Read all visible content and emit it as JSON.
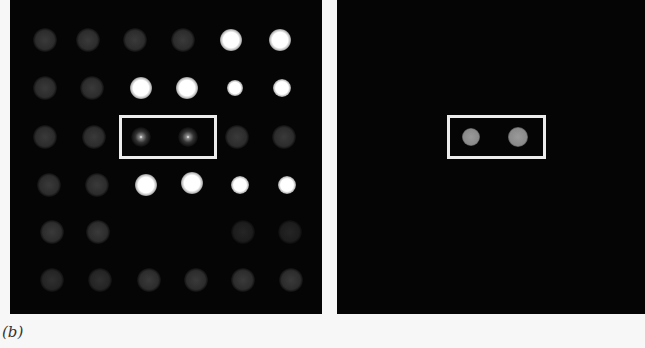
{
  "figure": {
    "caption": "(b)",
    "left_panel": {
      "description": "fluorescence microarray spots, 6x6 grid",
      "highlight_box": {
        "x": 109,
        "y": 115,
        "w": 98,
        "h": 44
      }
    },
    "right_panel": {
      "description": "filtered spots showing two highlighted spots",
      "highlight_box": {
        "x": 110,
        "y": 115,
        "w": 99,
        "h": 44
      }
    }
  }
}
